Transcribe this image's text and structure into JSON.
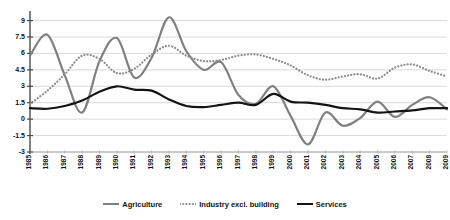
{
  "chart_data": {
    "type": "line",
    "title": "",
    "xlabel": "",
    "ylabel": "",
    "ylim": [
      -3,
      9.6
    ],
    "ytick_values": [
      9,
      7.5,
      6,
      4.5,
      3,
      1.5,
      0,
      -1.5,
      -3
    ],
    "ytick_labels": [
      "9",
      "7.5",
      "6",
      "4.5",
      "3",
      "1.5",
      "0",
      "-1.5",
      "-3"
    ],
    "grid": true,
    "legend_position": "bottom",
    "categories": [
      "1985",
      "1986",
      "1987",
      "1988",
      "1989",
      "1990",
      "1991",
      "1992",
      "1993",
      "1994",
      "1995",
      "1996",
      "1997",
      "1998",
      "1999",
      "2000",
      "2001",
      "2002",
      "2003",
      "2004",
      "2005",
      "2006",
      "2007",
      "2008",
      "2009"
    ],
    "series": [
      {
        "name": "Agriculture",
        "color": "#808080",
        "style": "solid",
        "values": [
          5.8,
          7.7,
          4.0,
          0.6,
          5.3,
          7.4,
          3.8,
          5.6,
          9.3,
          6.2,
          4.5,
          5.2,
          2.2,
          1.4,
          3.0,
          0.3,
          -2.3,
          0.6,
          -0.6,
          0.1,
          1.6,
          0.2,
          1.3,
          2.0,
          0.9
        ]
      },
      {
        "name": "Industry excl. building",
        "color": "#8c8c8c",
        "style": "dotted",
        "values": [
          1.4,
          2.6,
          4.1,
          5.8,
          5.5,
          4.2,
          4.6,
          5.9,
          6.7,
          5.8,
          5.3,
          5.4,
          5.8,
          5.9,
          5.5,
          4.9,
          4.0,
          3.6,
          3.9,
          4.1,
          3.7,
          4.7,
          5.0,
          4.4,
          3.9
        ]
      },
      {
        "name": "Services",
        "color": "#141414",
        "style": "solid",
        "values": [
          1.0,
          0.95,
          1.2,
          1.7,
          2.5,
          3.0,
          2.7,
          2.6,
          1.8,
          1.2,
          1.1,
          1.3,
          1.5,
          1.3,
          2.3,
          1.6,
          1.5,
          1.3,
          1.0,
          0.9,
          0.6,
          0.7,
          0.8,
          1.0,
          1.0
        ]
      }
    ]
  },
  "legend": {
    "items": [
      {
        "label": "Agriculture"
      },
      {
        "label": "Industry excl. building"
      },
      {
        "label": "Services"
      }
    ]
  }
}
